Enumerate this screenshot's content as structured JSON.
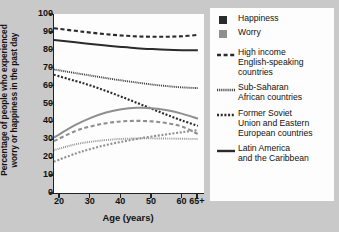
{
  "axes": {
    "ylabel_lines": [
      "Percentage of people who experienced",
      "worry or happiness in the past day"
    ],
    "xlabel": "Age (years)",
    "yticks": [
      "0",
      "10",
      "20",
      "30",
      "40",
      "50",
      "60",
      "70",
      "80",
      "90",
      "100"
    ],
    "xticks": [
      "20",
      "30",
      "40",
      "50",
      "60",
      "65+"
    ]
  },
  "legend": {
    "measures": [
      {
        "name": "Happiness",
        "color": "#2b2b2b"
      },
      {
        "name": "Worry",
        "color": "#8f8f8f"
      }
    ],
    "regions": [
      {
        "name_lines": [
          "High income",
          "English-speaking",
          "countries"
        ],
        "style": "dash-long"
      },
      {
        "name_lines": [
          "Sub-Saharan",
          "African countries"
        ],
        "style": "dot-fine"
      },
      {
        "name_lines": [
          "Former Soviet",
          "Union and Eastern",
          "European countries"
        ],
        "style": "dot-coarse"
      },
      {
        "name_lines": [
          "Latin America",
          "and the Caribbean"
        ],
        "style": "solid"
      }
    ]
  },
  "chart_data": {
    "type": "line",
    "title": "",
    "xlabel": "Age (years)",
    "ylabel": "Percentage of people who experienced worry or happiness in the past day",
    "xlim": [
      18,
      67
    ],
    "ylim": [
      0,
      100
    ],
    "xticks": [
      20,
      30,
      40,
      50,
      60,
      65
    ],
    "yticks": [
      0,
      10,
      20,
      30,
      40,
      50,
      60,
      70,
      80,
      90,
      100
    ],
    "grid": false,
    "legend_position": "right",
    "x": [
      18,
      25,
      30,
      35,
      40,
      45,
      50,
      55,
      60,
      65
    ],
    "series": [
      {
        "name": "High income English-speaking countries — Happiness",
        "measure": "Happiness",
        "region": "High income English-speaking countries",
        "style": "dash-long",
        "color": "#2b2b2b",
        "values": [
          92.0,
          90.6,
          89.6,
          88.7,
          88.0,
          87.5,
          87.3,
          87.3,
          87.6,
          88.3
        ]
      },
      {
        "name": "Latin America and the Caribbean — Happiness",
        "measure": "Happiness",
        "region": "Latin America and the Caribbean",
        "style": "solid",
        "color": "#2b2b2b",
        "values": [
          85.5,
          84.2,
          83.3,
          82.4,
          81.6,
          80.9,
          80.4,
          80.0,
          79.8,
          79.7
        ]
      },
      {
        "name": "Sub-Saharan African countries — Happiness",
        "measure": "Happiness",
        "region": "Sub-Saharan African countries",
        "style": "dot-fine",
        "color": "#2b2b2b",
        "values": [
          69.0,
          67.0,
          65.6,
          64.2,
          62.9,
          61.7,
          60.6,
          59.7,
          59.0,
          58.6
        ]
      },
      {
        "name": "Former Soviet Union and Eastern European countries — Happiness",
        "measure": "Happiness",
        "region": "Former Soviet Union and Eastern European countries",
        "style": "dot-coarse",
        "color": "#2b2b2b",
        "values": [
          66.0,
          62.6,
          60.0,
          57.0,
          53.8,
          50.4,
          47.0,
          43.6,
          40.4,
          37.5
        ]
      },
      {
        "name": "Latin America and the Caribbean — Worry",
        "measure": "Worry",
        "region": "Latin America and the Caribbean",
        "style": "solid",
        "color": "#8f8f8f",
        "values": [
          31.0,
          38.0,
          42.0,
          45.0,
          46.8,
          47.6,
          47.4,
          46.2,
          44.2,
          41.5
        ]
      },
      {
        "name": "High income English-speaking countries — Worry",
        "measure": "Worry",
        "region": "High income English-speaking countries",
        "style": "dash-long",
        "color": "#8f8f8f",
        "values": [
          29.0,
          34.6,
          37.2,
          39.0,
          40.0,
          40.3,
          40.0,
          39.0,
          37.0,
          33.0
        ]
      },
      {
        "name": "Sub-Saharan African countries — Worry",
        "measure": "Worry",
        "region": "Sub-Saharan African countries",
        "style": "dot-fine",
        "color": "#8f8f8f",
        "values": [
          24.0,
          27.2,
          28.6,
          29.6,
          30.2,
          30.5,
          30.5,
          30.4,
          30.3,
          30.2
        ]
      },
      {
        "name": "Former Soviet Union and Eastern European countries — Worry",
        "measure": "Worry",
        "region": "Former Soviet Union and Eastern European countries",
        "style": "dot-coarse",
        "color": "#8f8f8f",
        "values": [
          17.5,
          22.0,
          24.6,
          26.8,
          28.6,
          30.2,
          31.6,
          32.8,
          34.0,
          35.2
        ]
      }
    ]
  }
}
